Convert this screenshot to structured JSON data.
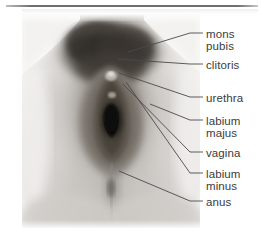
{
  "figure": {
    "type": "anatomical-photograph-diagram",
    "view": "frontal photographic view with leader-line callouts",
    "background_color": "#ffffff",
    "text_color": "#3b3b3b",
    "leader_line_color": "#4a4a4a",
    "top_rule_color": "#6f6f6f"
  },
  "labels": [
    {
      "id": "mons-pubis",
      "line1": "mons",
      "line2": "pubis",
      "text_x": 206,
      "text_y": 36,
      "tick_x1": 190,
      "tick_x2": 203,
      "tick_y": 33,
      "leader_to_x": 128,
      "leader_to_y": 52
    },
    {
      "id": "clitoris",
      "line1": "clitoris",
      "line2": "",
      "text_x": 206,
      "text_y": 68,
      "tick_x1": 190,
      "tick_x2": 203,
      "tick_y": 64,
      "leader_to_x": 117,
      "leader_to_y": 59
    },
    {
      "id": "urethra",
      "line1": "urethra",
      "line2": "",
      "text_x": 206,
      "text_y": 101,
      "tick_x1": 190,
      "tick_x2": 203,
      "tick_y": 97,
      "leader_to_x": 119,
      "leader_to_y": 73
    },
    {
      "id": "labium-majus",
      "line1": "labium",
      "line2": "majus",
      "text_x": 206,
      "text_y": 124,
      "tick_x1": 190,
      "tick_x2": 203,
      "tick_y": 120,
      "leader_to_x": 150,
      "leader_to_y": 104
    },
    {
      "id": "vagina",
      "line1": "vagina",
      "line2": "",
      "text_x": 206,
      "text_y": 155,
      "tick_x1": 190,
      "tick_x2": 203,
      "tick_y": 152,
      "leader_to_x": 123,
      "leader_to_y": 84
    },
    {
      "id": "labium-minus",
      "line1": "labium",
      "line2": "minus",
      "text_x": 206,
      "text_y": 177,
      "tick_x1": 190,
      "tick_x2": 203,
      "tick_y": 173,
      "leader_to_x": 126,
      "leader_to_y": 82
    },
    {
      "id": "anus",
      "line1": "anus",
      "line2": "",
      "text_x": 206,
      "text_y": 204,
      "tick_x1": 190,
      "tick_x2": 203,
      "tick_y": 201,
      "leader_to_x": 119,
      "leader_to_y": 171
    }
  ]
}
